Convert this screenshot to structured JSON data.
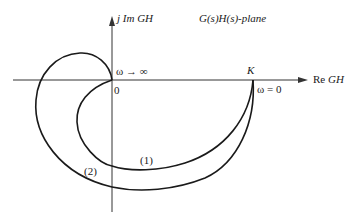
{
  "diagram": {
    "plane_title": "G(s)H(s)-plane",
    "axes": {
      "imag_label_prefix": "j Im ",
      "imag_label_var": "GH",
      "real_label_prefix": "Re ",
      "real_label_var": "GH",
      "origin_label": "0"
    },
    "points": {
      "k_label": "K",
      "omega_zero_label": "ω = 0",
      "omega_inf_label": "ω → ∞"
    },
    "curves": [
      {
        "id": "1",
        "label": "(1)"
      },
      {
        "id": "2",
        "label": "(2)"
      }
    ],
    "colors": {
      "line": "#1a1a1a",
      "axis": "#333333",
      "background": "#ffffff"
    }
  }
}
